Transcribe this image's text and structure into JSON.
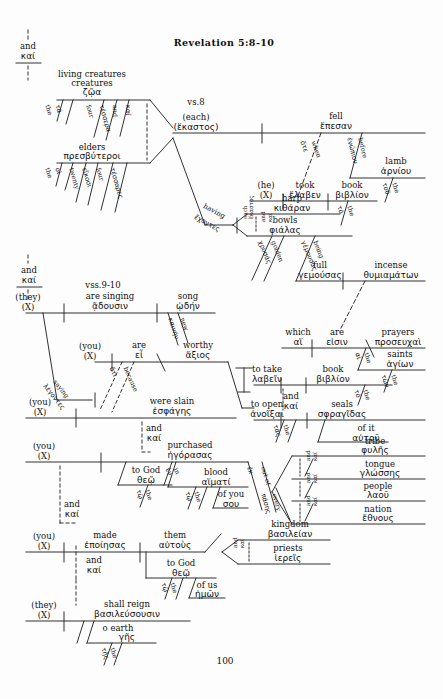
{
  "page": {
    "title": "Revelation 5:8-10",
    "page_number": "100",
    "verse_markers": [
      {
        "id": "vs8",
        "label": "vs.8"
      },
      {
        "id": "vss910",
        "label": "vss.9-10"
      }
    ]
  },
  "conjunctions": [
    {
      "id": "kai-top",
      "english": "and",
      "greek": "καί"
    },
    {
      "id": "kai-mid",
      "english": "and",
      "greek": "καί"
    },
    {
      "id": "kai-slain-purchased",
      "english": "and",
      "greek": "καί"
    },
    {
      "id": "kai-purchased-made",
      "english": "and",
      "greek": "καί"
    },
    {
      "id": "kai-made-reign",
      "english": "and",
      "greek": "καί"
    },
    {
      "id": "kai-take-open",
      "english": "and",
      "greek": "καί"
    }
  ],
  "clauses": [
    {
      "id": "clause-fell",
      "subject_en": "living creatures",
      "subject_gk": "ζῷα",
      "subject2_en": "elders",
      "subject2_gk": "πρεσβύτεροι",
      "appositive_en": "(each)",
      "appositive_gk": "(ἕκαστος)",
      "verb_en": "fell",
      "verb_gk": "ἔπεσαν",
      "modifiers": [
        {
          "en": "the",
          "gk": "τά"
        },
        {
          "en": "four",
          "gk": "τέσσερα"
        },
        {
          "en": "and",
          "gk": "καί"
        },
        {
          "en": "the",
          "gk": "οἱ"
        },
        {
          "en": "twenty",
          "gk": "εἴκοσι"
        },
        {
          "en": "four",
          "gk": "τέσσαρες"
        },
        {
          "en": "when",
          "gk": "ὅτε"
        },
        {
          "en": "before",
          "gk": "ἐνώπιον"
        },
        {
          "en": "lamb",
          "gk": "ἀρνίου"
        },
        {
          "en": "the",
          "gk": "τοῦ"
        }
      ]
    },
    {
      "id": "clause-took",
      "subject_en": "(he)",
      "subject_gk": "(X)",
      "verb_en": "took",
      "verb_gk": "ἔλαβεν",
      "object_en": "book",
      "object_gk": "βιβλίον",
      "modifiers": [
        {
          "en": "the",
          "gk": "τό"
        }
      ]
    },
    {
      "id": "clause-having",
      "participle_en": "having",
      "participle_gk": "ἔχοντες",
      "objects": [
        {
          "en": "harp",
          "gk": "κιθάραν"
        },
        {
          "en": "bowls",
          "gk": "φιάλας"
        }
      ],
      "modifiers": [
        {
          "en": "each",
          "gk": "ἕκαστος"
        },
        {
          "en": "and",
          "gk": "καί"
        },
        {
          "en": "golden",
          "gk": "χρυσάς"
        },
        {
          "en": "being",
          "gk": "γέμουσας"
        }
      ],
      "predicate_en": "full",
      "predicate_gk": "γεμούσας",
      "complement_en": "incense",
      "complement_gk": "θυμιαμάτων"
    },
    {
      "id": "clause-which-are",
      "subject_en": "which",
      "subject_gk": "αἵ",
      "verb_en": "are",
      "verb_gk": "εἰσιν",
      "predicate_en": "prayers",
      "predicate_gk": "προσευχαὶ",
      "object2_en": "saints",
      "object2_gk": "ἁγίων",
      "modifiers": [
        {
          "en": "the",
          "gk": "αἱ"
        },
        {
          "en": "the",
          "gk": "τῶν"
        }
      ]
    },
    {
      "id": "clause-singing",
      "subject_en": "(they)",
      "subject_gk": "(X)",
      "verb_en": "are singing",
      "verb_gk": "ᾷδουσιν",
      "object_en": "song",
      "object_gk": "ᾠδήν",
      "modifiers": [
        {
          "en": "new",
          "gk": "καινήν"
        }
      ]
    },
    {
      "id": "clause-worthy",
      "subject_en": "(you)",
      "subject_gk": "(X)",
      "verb_en": "are",
      "verb_gk": "εἶ",
      "predicate_en": "worthy",
      "predicate_gk": "ἄξιος",
      "modifiers": [
        {
          "en": "saying",
          "gk": "λέγοντες"
        },
        {
          "en": "because",
          "gk": "ὅτι"
        }
      ],
      "infinitives": [
        {
          "en": "to take",
          "gk": "λαβεῖν",
          "obj_en": "book",
          "obj_gk": "βιβλίον",
          "art_en": "the",
          "art_gk": "τό"
        },
        {
          "en": "to open",
          "gk": "ἀνοῖξαι",
          "obj_en": "seals",
          "obj_gk": "σφραγῖδας",
          "art_en": "the",
          "art_gk": "τάς",
          "poss_en": "of it",
          "poss_gk": "αὐτοῦ"
        }
      ]
    },
    {
      "id": "clause-slain",
      "subject_en": "(you)",
      "subject_gk": "(X)",
      "verb_en": "were slain",
      "verb_gk": "ἐσφάγης"
    },
    {
      "id": "clause-purchased",
      "subject_en": "(you)",
      "subject_gk": "(X)",
      "verb_en": "purchased",
      "verb_gk": "ἠγόρασας",
      "indirect_en": "to God",
      "indirect_gk": "θεῷ",
      "instrument_en": "blood",
      "instrument_gk": "αἵματί",
      "possessive_en": "of you",
      "possessive_gk": "σου",
      "modifiers": [
        {
          "en": "the",
          "gk": "τῷ"
        },
        {
          "en": "in",
          "gk": "ἐν"
        },
        {
          "en": "the",
          "gk": "τῷ"
        },
        {
          "en": "out of",
          "gk": "ἐκ"
        },
        {
          "en": "every",
          "gk": "πάσης"
        }
      ],
      "out_of_list": [
        {
          "en": "tribe",
          "gk": "φυλῆς"
        },
        {
          "en": "tongue",
          "gk": "γλώσσης"
        },
        {
          "en": "people",
          "gk": "λαοῦ"
        },
        {
          "en": "nation",
          "gk": "ἔθνους"
        }
      ],
      "out_of_conj": {
        "en": "and",
        "gk": "καί"
      }
    },
    {
      "id": "clause-made",
      "subject_en": "(you)",
      "subject_gk": "(X)",
      "verb_en": "made",
      "verb_gk": "ἐποίησας",
      "object_en": "them",
      "object_gk": "αὐτοὺς",
      "indirect_en": "to God",
      "indirect_gk": "θεῷ",
      "possessive_en": "of us",
      "possessive_gk": "ἡμῶν",
      "complements": [
        {
          "en": "kingdom",
          "gk": "βασιλείαν"
        },
        {
          "en": "priests",
          "gk": "ἱερεῖς"
        }
      ],
      "modifiers": [
        {
          "en": "the",
          "gk": "τῷ"
        },
        {
          "en": "and",
          "gk": "καί"
        }
      ]
    },
    {
      "id": "clause-reign",
      "subject_en": "(they)",
      "subject_gk": "(X)",
      "verb_en": "shall reign",
      "verb_gk": "βασιλεύσουσιν",
      "modifier_en": "o earth",
      "modifier_gk": "γῆς",
      "sub_en": "the",
      "sub_gk": "τῆς"
    }
  ]
}
